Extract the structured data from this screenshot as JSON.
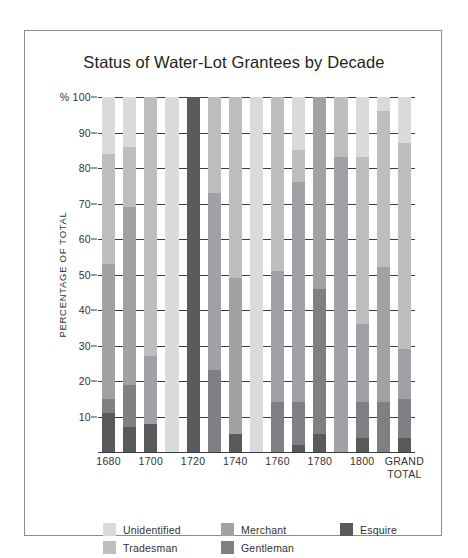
{
  "figure": {
    "title": "Status of Water-Lot Grantees by Decade",
    "background": "#ffffff",
    "frame_color": "#8d8d8d"
  },
  "chart_data": {
    "type": "bar",
    "stacked": true,
    "title": "Status of Water-Lot Grantees by Decade",
    "xlabel": "",
    "ylabel": "PERCENTAGE OF TOTAL",
    "y_axis_prefix": "%",
    "ylim": [
      0,
      100
    ],
    "ytick_labels": [
      "% 100",
      "90",
      "80",
      "70",
      "60",
      "50",
      "40",
      "30",
      "20",
      "10"
    ],
    "yticks": [
      100,
      90,
      80,
      70,
      60,
      50,
      40,
      30,
      20,
      10
    ],
    "grid": true,
    "legend_position": "bottom",
    "categories": [
      "1680",
      "1690",
      "1700",
      "1710",
      "1720",
      "1730",
      "1740",
      "1750",
      "1760",
      "1770",
      "1780",
      "1790",
      "1800",
      "1810",
      "GRAND\nTOTAL"
    ],
    "tick_labels": [
      "1680",
      "",
      "1700",
      "",
      "1720",
      "",
      "1740",
      "",
      "1760",
      "",
      "1780",
      "",
      "1800",
      "",
      "GRAND\nTOTAL"
    ],
    "series": [
      {
        "name": "Esquire",
        "color": "#595a5c",
        "values": [
          11,
          7,
          8,
          0,
          100,
          0,
          5,
          0,
          0,
          2,
          5,
          0,
          4,
          0,
          4
        ]
      },
      {
        "name": "Gentleman",
        "color": "#7f8083",
        "values": [
          4,
          12,
          0,
          0,
          0,
          23,
          0,
          0,
          14,
          12,
          41,
          0,
          10,
          14,
          11
        ]
      },
      {
        "name": "Merchant",
        "color": "#9fa1a4",
        "values": [
          38,
          50,
          19,
          0,
          0,
          50,
          44,
          0,
          37,
          62,
          54,
          83,
          22,
          38,
          14
        ]
      },
      {
        "name": "Tradesman",
        "color": "#bcbec0",
        "values": [
          31,
          17,
          73,
          0,
          0,
          27,
          51,
          0,
          49,
          9,
          0,
          17,
          47,
          44,
          58
        ]
      },
      {
        "name": "Unidentified",
        "color": "#d9dadb",
        "values": [
          16,
          14,
          0,
          100,
          0,
          0,
          0,
          100,
          0,
          15,
          0,
          0,
          17,
          4,
          13
        ]
      }
    ]
  },
  "legend": {
    "items": [
      {
        "label": "Unidentified",
        "color": "#d9dadb"
      },
      {
        "label": "Merchant",
        "color": "#9fa1a4"
      },
      {
        "label": "Esquire",
        "color": "#595a5c"
      },
      {
        "label": "Tradesman",
        "color": "#bcbec0"
      },
      {
        "label": "Gentleman",
        "color": "#7f8083"
      }
    ]
  }
}
